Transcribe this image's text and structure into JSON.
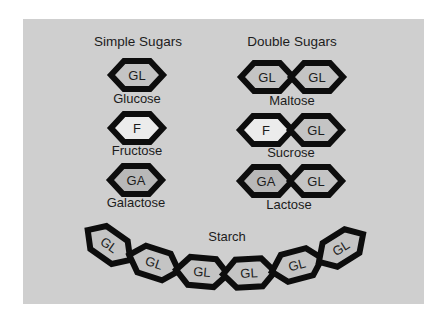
{
  "colors": {
    "panel": "#cfcfcf",
    "outline": "#0d0d0d",
    "fill_gl": "#c4c4c4",
    "fill_f": "#ececec",
    "fill_ga": "#b8b8b8",
    "text": "#1c1c1c"
  },
  "headings": {
    "simple": "Simple Sugars",
    "double": "Double Sugars",
    "starch": "Starch"
  },
  "simple_sugars": [
    {
      "name": "Glucose",
      "unit": "GL"
    },
    {
      "name": "Fructose",
      "unit": "F"
    },
    {
      "name": "Galactose",
      "unit": "GA"
    }
  ],
  "double_sugars": [
    {
      "name": "Maltose",
      "units": [
        "GL",
        "GL"
      ]
    },
    {
      "name": "Sucrose",
      "units": [
        "F",
        "GL"
      ]
    },
    {
      "name": "Lactose",
      "units": [
        "GA",
        "GL"
      ]
    }
  ],
  "starch": {
    "units": [
      "GL",
      "GL",
      "GL",
      "GL",
      "GL",
      "GL"
    ]
  }
}
